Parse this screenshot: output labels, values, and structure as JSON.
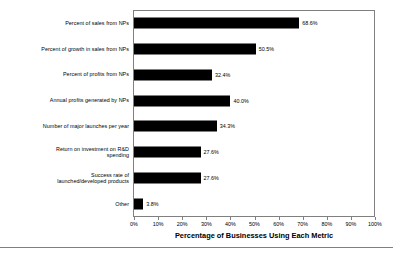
{
  "chart_data": {
    "type": "bar",
    "orientation": "horizontal",
    "title": "",
    "xlabel": "Percentage of Businesses Using Each Metric",
    "ylabel": "",
    "xlim": [
      0,
      100
    ],
    "grid": false,
    "legend": null,
    "categories": [
      "Percent of sales from NPs",
      "Percent of growth in sales from NPs",
      "Percent of profits from NPs",
      "Annual profits generated by NPs",
      "Number of major launches per year",
      "Return on investment on R&D\nspending",
      "Success rate of\nlaunched/developed products",
      "Other"
    ],
    "values": [
      68.6,
      50.5,
      32.4,
      40.0,
      34.3,
      27.6,
      27.6,
      3.8
    ],
    "data_labels": [
      "68.6%",
      "50.5%",
      "32.4%",
      "40.0%",
      "34.3%",
      "27.6%",
      "27.6%",
      "3.8%"
    ],
    "xticks": [
      0,
      10,
      20,
      30,
      40,
      50,
      60,
      70,
      80,
      90,
      100
    ],
    "xtick_labels": [
      "0%",
      "10%",
      "20%",
      "30%",
      "40%",
      "50%",
      "60%",
      "70%",
      "80%",
      "90%",
      "100%"
    ],
    "bar_color": "#000000",
    "frame_color": "#808080",
    "background": "#ffffff"
  }
}
